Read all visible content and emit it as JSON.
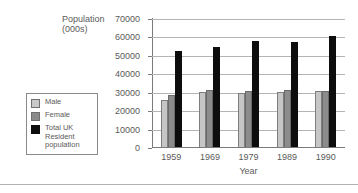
{
  "chart_data": {
    "type": "bar",
    "title": "",
    "xlabel": "Year",
    "ylabel": "Population\n(000s)",
    "categories": [
      "1959",
      "1969",
      "1979",
      "1989",
      "1990"
    ],
    "series": [
      {
        "name": "Male",
        "color": "#c6c6c6",
        "values": [
          25500,
          29600,
          29300,
          29700,
          30300
        ]
      },
      {
        "name": "Female",
        "color": "#8c8c8c",
        "values": [
          28400,
          30700,
          30500,
          30700,
          30600
        ]
      },
      {
        "name": "Total UK\nResident\npopulation",
        "color": "#0d0d0d",
        "values": [
          52300,
          54200,
          57500,
          57000,
          60000
        ]
      }
    ],
    "ylim": [
      0,
      70000
    ],
    "ytick_step": 10000,
    "yticks": [
      "70000",
      "60000",
      "50000",
      "40000",
      "30000",
      "20000",
      "10000",
      "0"
    ],
    "grid": true,
    "legend_position": "left-outside"
  },
  "legend": {
    "items": [
      {
        "label": "Male",
        "swatch": "male"
      },
      {
        "label": "Female",
        "swatch": "female"
      },
      {
        "label": "Total UK\nResident\npopulation",
        "swatch": "total"
      }
    ]
  },
  "axis": {
    "y_title": "Population\n(000s)",
    "x_title": "Year"
  }
}
